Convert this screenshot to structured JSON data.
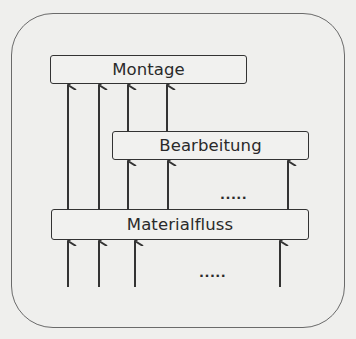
{
  "diagram": {
    "type": "layered-flow",
    "boxes": {
      "montage": "Montage",
      "bearbeitung": "Bearbeitung",
      "materialfluss": "Materialfluss"
    },
    "ellipsis_middle": ".....",
    "ellipsis_bottom": ".....",
    "colors": {
      "background": "#efefed",
      "stroke": "#333333",
      "frame": "#6a6a6a",
      "text": "#2a2a2a"
    },
    "flows": [
      {
        "from": "input",
        "to": "Materialfluss",
        "count_shown": 4
      },
      {
        "from": "Materialfluss",
        "to": "Bearbeitung",
        "count_shown": 3
      },
      {
        "from": "Materialfluss",
        "to": "Montage",
        "count_shown": 2
      },
      {
        "from": "Bearbeitung",
        "to": "Montage",
        "count_shown": 2
      }
    ]
  }
}
